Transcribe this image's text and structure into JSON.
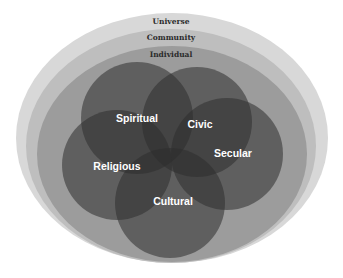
{
  "diagram": {
    "type": "nested-ellipses-with-overlapping-circles",
    "rings": [
      {
        "id": "universe",
        "label": "Universe",
        "color": "#d8d8d8"
      },
      {
        "id": "community",
        "label": "Community",
        "color": "#bebebe"
      },
      {
        "id": "individual",
        "label": "Individual",
        "color": "#9c9c9c"
      }
    ],
    "circles": [
      {
        "id": "spiritual",
        "label": "Spiritual"
      },
      {
        "id": "civic",
        "label": "Civic"
      },
      {
        "id": "secular",
        "label": "Secular"
      },
      {
        "id": "cultural",
        "label": "Cultural"
      },
      {
        "id": "religious",
        "label": "Religious"
      }
    ],
    "circle_color": "#3a3a3a",
    "background": "#ffffff"
  }
}
